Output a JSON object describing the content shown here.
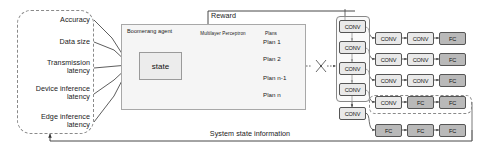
{
  "diagram": {
    "inputs": {
      "group_name": "system-metrics-group",
      "items": [
        {
          "label": "Accuracy"
        },
        {
          "label": "Data size"
        },
        {
          "label": "Transmission\nlatency"
        },
        {
          "label": "Device inference\nlatency"
        },
        {
          "label": "Edge inference\nlatency"
        }
      ]
    },
    "agent": {
      "title": "Boomerang agent",
      "state_label": "state",
      "network_label": "Multilayer Perceptron",
      "plans_label": "Plans",
      "plans": [
        {
          "label": "Plan 1"
        },
        {
          "label": "Plan 2"
        },
        {
          "label": "Plan n-1"
        },
        {
          "label": "Plan n"
        }
      ]
    },
    "edges": {
      "reward_label": "Reward",
      "feedback_label": "System state information"
    },
    "dnn": {
      "backbone": [
        {
          "label": "CONV"
        },
        {
          "label": "CONV"
        },
        {
          "label": "CONV"
        },
        {
          "label": "CONV"
        },
        {
          "label": "CONV"
        }
      ],
      "branches": [
        {
          "blocks": [
            {
              "label": "CONV"
            },
            {
              "label": "CONV"
            },
            {
              "label": "FC"
            }
          ],
          "highlighted": false
        },
        {
          "blocks": [
            {
              "label": "CONV"
            },
            {
              "label": "CONV"
            },
            {
              "label": "FC"
            }
          ],
          "highlighted": false
        },
        {
          "blocks": [
            {
              "label": "CONV"
            },
            {
              "label": "CONV"
            },
            {
              "label": "FC"
            }
          ],
          "highlighted": false
        },
        {
          "blocks": [
            {
              "label": "CONV"
            },
            {
              "label": "FC"
            },
            {
              "label": "FC"
            }
          ],
          "highlighted": true
        },
        {
          "blocks": [
            {
              "label": "FC"
            },
            {
              "label": "FC"
            },
            {
              "label": "FC"
            }
          ],
          "highlighted": false
        }
      ]
    },
    "colors": {
      "conv_fill": "#e9e9e9",
      "fc_fill": "#b9b9b9",
      "line": "#555555",
      "dashed": "#8a8a8a"
    }
  }
}
